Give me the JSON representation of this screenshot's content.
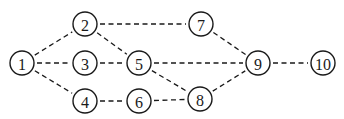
{
  "diagram": {
    "type": "network-graph",
    "edge_style": "dashed",
    "nodes": [
      {
        "id": "1",
        "label": "1",
        "x": 22,
        "y": 63
      },
      {
        "id": "2",
        "label": "2",
        "x": 85,
        "y": 24
      },
      {
        "id": "3",
        "label": "3",
        "x": 85,
        "y": 63
      },
      {
        "id": "4",
        "label": "4",
        "x": 85,
        "y": 101
      },
      {
        "id": "5",
        "label": "5",
        "x": 139,
        "y": 63
      },
      {
        "id": "6",
        "label": "6",
        "x": 139,
        "y": 101
      },
      {
        "id": "7",
        "label": "7",
        "x": 201,
        "y": 24
      },
      {
        "id": "8",
        "label": "8",
        "x": 200,
        "y": 99
      },
      {
        "id": "9",
        "label": "9",
        "x": 258,
        "y": 63
      },
      {
        "id": "10",
        "label": "10",
        "x": 323,
        "y": 63
      }
    ],
    "edges": [
      [
        "1",
        "2"
      ],
      [
        "1",
        "3"
      ],
      [
        "1",
        "4"
      ],
      [
        "2",
        "7"
      ],
      [
        "2",
        "5"
      ],
      [
        "3",
        "5"
      ],
      [
        "4",
        "6"
      ],
      [
        "5",
        "9"
      ],
      [
        "5",
        "8"
      ],
      [
        "6",
        "8"
      ],
      [
        "7",
        "9"
      ],
      [
        "8",
        "9"
      ],
      [
        "9",
        "10"
      ]
    ]
  }
}
